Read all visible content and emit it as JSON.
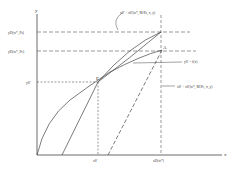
{
  "diagram": {
    "axes": {
      "x_label": "x",
      "y_label": "y"
    },
    "y_labels": {
      "top": "yD(w*, Ps)",
      "mid": "yD(w*, Pc)",
      "low": "yS'"
    },
    "x_labels": {
      "left": "xS'",
      "right": "xD(w*)"
    },
    "points": {
      "A": "A",
      "E": "E"
    },
    "curve_labels": {
      "top_curve": "xS' + xS'(w*, M/Ps, π, y)",
      "middle_curve": "yS' = f(x)",
      "dashed_curve": "xS' + xS'(w*, M/Pc, π, y)"
    }
  }
}
